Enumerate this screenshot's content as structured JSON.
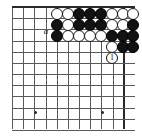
{
  "figure": {
    "kind": "go-board-diagram",
    "width": 142,
    "height": 137,
    "region": "top-right corner",
    "background_color": "#ffffff",
    "line_color": "#5a5a5a",
    "edge_color": "#2a2a2a"
  },
  "board": {
    "origin_x": 12,
    "origin_y": 7,
    "spacing": 11.17,
    "columns": 11,
    "rows": 12,
    "top_edge": true,
    "right_edge": true,
    "hoshi": [
      {
        "cx": 35,
        "cy": 112
      },
      {
        "cx": 102,
        "cy": 112
      }
    ]
  },
  "stones": [
    {
      "color": "white",
      "cx": 57,
      "cy": 14,
      "name": "stone-white-r1-c1"
    },
    {
      "color": "white",
      "cx": 68,
      "cy": 14,
      "name": "stone-white-r1-c2"
    },
    {
      "color": "black",
      "cx": 79,
      "cy": 14,
      "name": "stone-black-r1-c3"
    },
    {
      "color": "black",
      "cx": 90,
      "cy": 14,
      "name": "stone-black-r1-c4"
    },
    {
      "color": "black",
      "cx": 101,
      "cy": 14,
      "name": "stone-black-r1-c5"
    },
    {
      "color": "white",
      "cx": 112,
      "cy": 14,
      "name": "stone-white-r1-c6"
    },
    {
      "color": "white",
      "cx": 123,
      "cy": 14,
      "name": "stone-white-r1-c7"
    },
    {
      "color": "white",
      "cx": 133,
      "cy": 14,
      "name": "stone-white-r1-c8"
    },
    {
      "color": "black",
      "cx": 57,
      "cy": 25,
      "name": "stone-black-r2-c1"
    },
    {
      "color": "white",
      "cx": 68,
      "cy": 25,
      "name": "stone-white-r2-c2"
    },
    {
      "color": "black",
      "cx": 79,
      "cy": 25,
      "name": "stone-black-r2-c3"
    },
    {
      "color": "black",
      "cx": 90,
      "cy": 25,
      "name": "stone-black-r2-c4"
    },
    {
      "color": "black",
      "cx": 101,
      "cy": 25,
      "name": "stone-black-r2-c5"
    },
    {
      "color": "white",
      "cx": 112,
      "cy": 25,
      "name": "stone-white-r2-c6"
    },
    {
      "color": "white",
      "cx": 123,
      "cy": 25,
      "name": "stone-white-r2-c7"
    },
    {
      "color": "black",
      "cx": 133,
      "cy": 25,
      "name": "stone-black-r2-c8"
    },
    {
      "color": "black",
      "cx": 57,
      "cy": 36,
      "name": "stone-black-r3-c1"
    },
    {
      "color": "white",
      "cx": 68,
      "cy": 36,
      "name": "stone-white-r3-c2"
    },
    {
      "color": "white",
      "cx": 79,
      "cy": 36,
      "name": "stone-white-r3-c3"
    },
    {
      "color": "white",
      "cx": 90,
      "cy": 36,
      "name": "stone-white-r3-c4"
    },
    {
      "color": "white",
      "cx": 101,
      "cy": 36,
      "name": "stone-white-r3-c5"
    },
    {
      "color": "black",
      "cx": 112,
      "cy": 36,
      "name": "stone-black-r3-c6"
    },
    {
      "color": "black",
      "cx": 123,
      "cy": 36,
      "name": "stone-black-r3-c7"
    },
    {
      "color": "black",
      "cx": 133,
      "cy": 36,
      "name": "stone-black-r3-c8"
    },
    {
      "color": "white",
      "cx": 112,
      "cy": 47,
      "name": "stone-white-r4-c6"
    },
    {
      "color": "black",
      "cx": 123,
      "cy": 47,
      "name": "stone-black-r4-c7"
    },
    {
      "color": "black",
      "cx": 133,
      "cy": 47,
      "name": "stone-black-r4-c8"
    }
  ],
  "move_markers": [
    {
      "label": "1",
      "color": "white",
      "cx": 112,
      "cy": 58,
      "name": "move-marker-1"
    }
  ],
  "point_labels": [
    {
      "label": "a",
      "x": 46,
      "y": 27,
      "name": "point-label-a"
    }
  ]
}
